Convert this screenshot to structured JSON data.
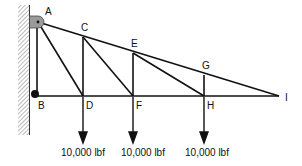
{
  "diagram": {
    "type": "cantilever truss",
    "nodes": [
      {
        "id": "A",
        "label": "A",
        "x": 38,
        "y": 22
      },
      {
        "id": "B",
        "label": "B",
        "x": 36,
        "y": 96
      },
      {
        "id": "C",
        "label": "C",
        "x": 83,
        "y": 37
      },
      {
        "id": "D",
        "label": "D",
        "x": 83,
        "y": 96
      },
      {
        "id": "E",
        "label": "E",
        "x": 133,
        "y": 53
      },
      {
        "id": "F",
        "label": "F",
        "x": 133,
        "y": 96
      },
      {
        "id": "G",
        "label": "G",
        "x": 204,
        "y": 75
      },
      {
        "id": "H",
        "label": "H",
        "x": 204,
        "y": 96
      },
      {
        "id": "I",
        "label": "I",
        "x": 279,
        "y": 96
      }
    ],
    "members": [
      [
        "A",
        "C"
      ],
      [
        "C",
        "E"
      ],
      [
        "E",
        "G"
      ],
      [
        "G",
        "I"
      ],
      [
        "B",
        "D"
      ],
      [
        "D",
        "F"
      ],
      [
        "F",
        "H"
      ],
      [
        "H",
        "I"
      ],
      [
        "A",
        "B"
      ],
      [
        "A",
        "D"
      ],
      [
        "C",
        "D"
      ],
      [
        "C",
        "F"
      ],
      [
        "E",
        "F"
      ],
      [
        "E",
        "H"
      ],
      [
        "G",
        "H"
      ]
    ],
    "supports": {
      "A": "pin",
      "B": "roller"
    },
    "loads": [
      {
        "node": "D",
        "label": "10,000 lbf",
        "direction": "down"
      },
      {
        "node": "F",
        "label": "10,000 lbf",
        "direction": "down"
      },
      {
        "node": "H",
        "label": "10,000 lbf",
        "direction": "down"
      }
    ],
    "labels": {
      "A": "A",
      "B": "B",
      "C": "C",
      "D": "D",
      "E": "E",
      "F": "F",
      "G": "G",
      "H": "H",
      "I": "I"
    },
    "load_labels": [
      "10,000 lbf",
      "10,000 lbf",
      "10,000 lbf"
    ],
    "colors": {
      "member": "#111111",
      "wall_hatch": "#777777",
      "pin_bracket": "#999999"
    }
  }
}
